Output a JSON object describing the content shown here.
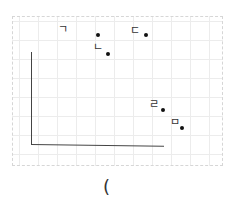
{
  "figure": {
    "top_fragment": "· ·",
    "points": [
      {
        "label": "ㄱ",
        "dot": {
          "x": 98,
          "y": 35
        },
        "label_pos": {
          "x": 58,
          "y": 24
        }
      },
      {
        "label": "ㄴ",
        "dot": {
          "x": 108,
          "y": 54
        },
        "label_pos": {
          "x": 93,
          "y": 42
        }
      },
      {
        "label": "ㄷ",
        "dot": {
          "x": 146,
          "y": 35
        },
        "label_pos": {
          "x": 130,
          "y": 25
        }
      },
      {
        "label": "ㄹ",
        "dot": {
          "x": 163,
          "y": 110
        },
        "label_pos": {
          "x": 149,
          "y": 99
        }
      },
      {
        "label": "ㅁ",
        "dot": {
          "x": 182,
          "y": 128
        },
        "label_pos": {
          "x": 170,
          "y": 117
        }
      }
    ],
    "caption": "("
  }
}
